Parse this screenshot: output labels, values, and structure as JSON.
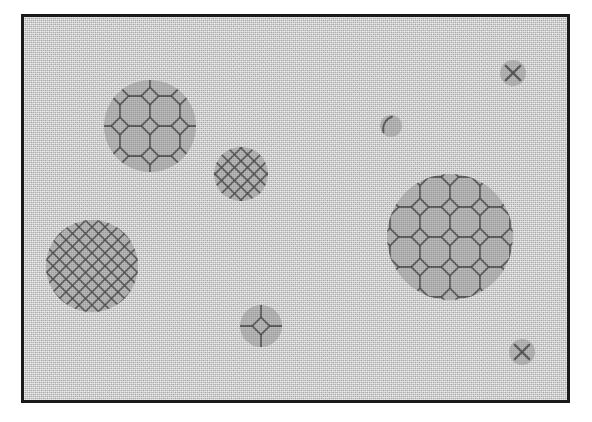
{
  "figure": {
    "title": "",
    "caption": "",
    "frame": {
      "x": 21,
      "y": 14,
      "width": 549,
      "height": 389,
      "border_width": 3,
      "border_color": "#1a1a1a"
    },
    "colors": {
      "page_background": "#ffffff",
      "field_background": "#c9c9c9",
      "particle_fill": "#a2a2a2",
      "lattice_line": "#4a4a4a",
      "frame_border": "#1a1a1a"
    },
    "patterns": {
      "truncated_square": "octagon-and-square tiling (coarse crystalline lattice)",
      "diamond_lattice": "fine diagonal cross-hatch diamond lattice",
      "cross": "single X cross",
      "partial_arc": "single short arc near the rim"
    },
    "particles": [
      {
        "id": "particle-top-left",
        "label": "large grain, coarse octagonal lattice",
        "cx": 150,
        "cy": 126,
        "r": 46,
        "pattern": "truncated_square",
        "cell": 30,
        "rotation": 0
      },
      {
        "id": "particle-mid-upper",
        "label": "small grain, fine diamond lattice",
        "cx": 241,
        "cy": 174,
        "r": 27,
        "pattern": "diamond_lattice",
        "cell": 13,
        "rotation": 0
      },
      {
        "id": "particle-bottom-left",
        "label": "large grain, fine diamond lattice",
        "cx": 92,
        "cy": 266,
        "r": 46,
        "pattern": "diamond_lattice",
        "cell": 13,
        "rotation": 0
      },
      {
        "id": "particle-right-large",
        "label": "largest grain, coarse octagonal lattice",
        "cx": 450,
        "cy": 237,
        "r": 63,
        "pattern": "truncated_square",
        "cell": 30,
        "rotation": 0
      },
      {
        "id": "particle-bottom-mid",
        "label": "medium grain, partial octagonal lattice",
        "cx": 261,
        "cy": 326,
        "r": 21,
        "pattern": "truncated_square",
        "cell": 30,
        "rotation": 0
      },
      {
        "id": "particle-top-right",
        "label": "tiny grain with cross",
        "cx": 513,
        "cy": 73,
        "r": 13,
        "pattern": "cross",
        "cell": 13,
        "rotation": 0
      },
      {
        "id": "particle-upper-mid-right",
        "label": "tiny grain with rim arc",
        "cx": 391,
        "cy": 126,
        "r": 11,
        "pattern": "partial_arc",
        "cell": 13,
        "rotation": 0
      },
      {
        "id": "particle-bottom-right",
        "label": "tiny grain with cross",
        "cx": 522,
        "cy": 352,
        "r": 13,
        "pattern": "cross",
        "cell": 13,
        "rotation": 0
      }
    ]
  }
}
